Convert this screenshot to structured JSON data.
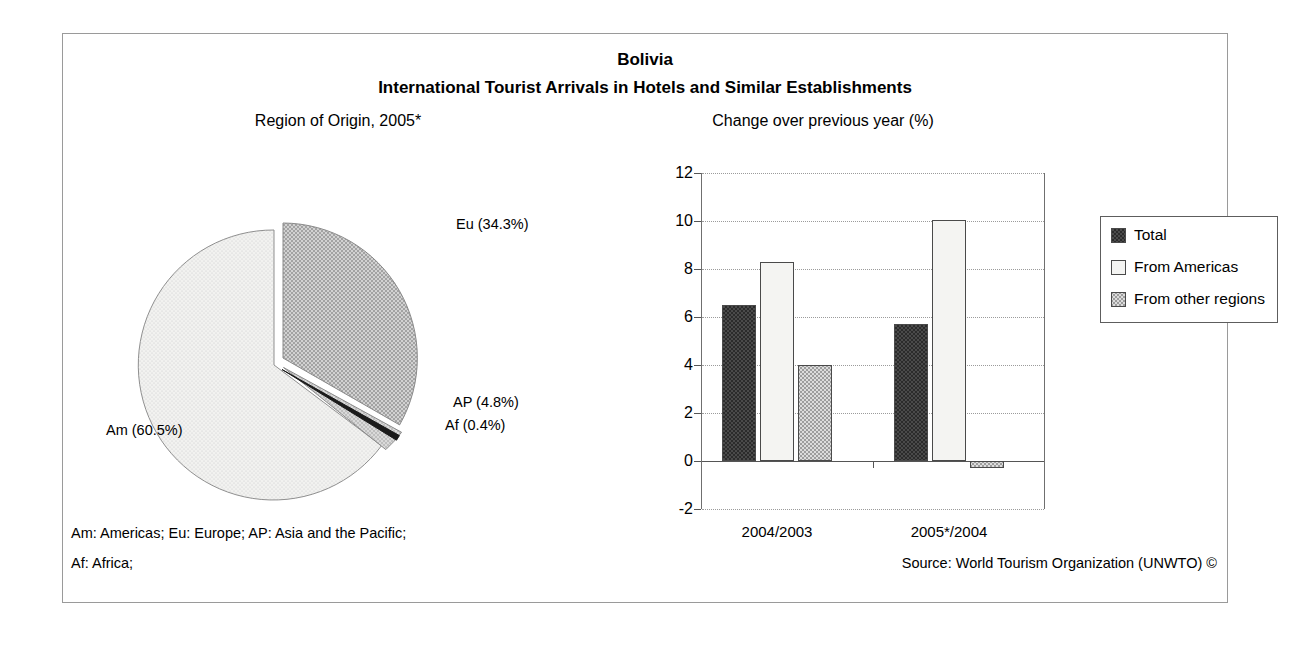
{
  "figure": {
    "title_country": "Bolivia",
    "title_main": "International Tourist Arrivals in Hotels and Similar Establishments",
    "pie_subtitle": "Region of Origin, 2005*",
    "bar_subtitle": "Change over previous year (%)",
    "note_line_1": "Am: Americas; Eu: Europe; AP: Asia and the Pacific;",
    "note_line_2": "Af: Africa;",
    "source": "Source: World Tourism Organization (UNWTO) ©"
  },
  "pie_labels": {
    "eu": "Eu (34.3%)",
    "ap": "AP (4.8%)",
    "af": "Af (0.4%)",
    "am": "Am (60.5%)"
  },
  "bar_axis": {
    "y_ticks": [
      "12",
      "10",
      "8",
      "6",
      "4",
      "2",
      "0",
      "-2"
    ],
    "x_ticks": [
      "2004/2003",
      "2005*/2004"
    ]
  },
  "legend": {
    "items": [
      {
        "label": "Total",
        "swatch": "dark-checker"
      },
      {
        "label": "From Americas",
        "swatch": "white"
      },
      {
        "label": "From other regions",
        "swatch": "light-stipple"
      }
    ]
  },
  "colors": {
    "frame": "#9a9a9a",
    "axis": "#555555",
    "grid": "#9b9b9b",
    "total_fill": "#4a4a4a",
    "americas_fill": "#f4f4f2",
    "other_fill": "#dcdcdc",
    "pie_am": "#ececec",
    "pie_eu": "#c9c9c9",
    "pie_ap": "#d6d6d6",
    "pie_af": "#1a1a1a"
  },
  "chart_data": [
    {
      "type": "pie",
      "title": "Region of Origin, 2005*",
      "legend_position": "callout-labels",
      "categories": [
        "Am",
        "Eu",
        "AP",
        "Af"
      ],
      "category_names": [
        "Americas",
        "Europe",
        "Asia and the Pacific",
        "Africa"
      ],
      "values": [
        60.5,
        34.3,
        4.8,
        0.4
      ],
      "unit": "%",
      "labels": [
        "Am (60.5%)",
        "Eu (34.3%)",
        "AP (4.8%)",
        "Af (0.4%)"
      ],
      "exploded": [
        "Eu",
        "AP",
        "Af"
      ]
    },
    {
      "type": "bar",
      "title": "Change over previous year (%)",
      "categories": [
        "2004/2003",
        "2005*/2004"
      ],
      "series": [
        {
          "name": "Total",
          "values": [
            6.5,
            5.7
          ]
        },
        {
          "name": "From Americas",
          "values": [
            8.3,
            10.05
          ]
        },
        {
          "name": "From other regions",
          "values": [
            4.0,
            -0.3
          ]
        }
      ],
      "xlabel": "",
      "ylabel": "",
      "ylim": [
        -2,
        12
      ],
      "ytick_step": 2,
      "grid": true,
      "legend_position": "top-right"
    }
  ]
}
